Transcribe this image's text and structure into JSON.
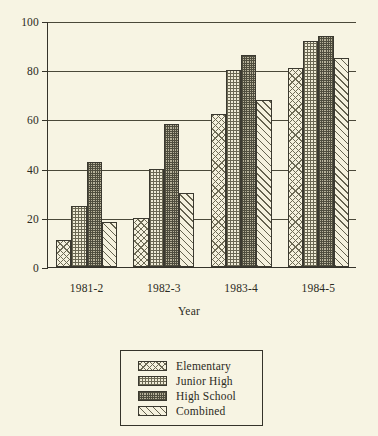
{
  "chart_data": {
    "type": "bar",
    "title": "",
    "xlabel": "Year",
    "ylabel": "",
    "ylim": [
      0,
      100
    ],
    "yticks": [
      0,
      20,
      40,
      60,
      80,
      100
    ],
    "ytick_labels": [
      "0",
      "20",
      "40",
      "60",
      "80",
      "100"
    ],
    "grid": true,
    "grid_axis": "y",
    "legend_position": "below-center",
    "categories": [
      "1981-2",
      "1982-3",
      "1983-4",
      "1984-5"
    ],
    "series": [
      {
        "name": "Elementary",
        "pattern": "cross-hatch",
        "values": [
          11,
          20,
          62,
          81
        ]
      },
      {
        "name": "Junior High",
        "pattern": "square-grid",
        "values": [
          25,
          40,
          80,
          92
        ]
      },
      {
        "name": "High School",
        "pattern": "dense-dots",
        "values": [
          42.5,
          58,
          86,
          94
        ]
      },
      {
        "name": "Combined",
        "pattern": "diagonal-hatch",
        "values": [
          18.5,
          30,
          68,
          85
        ]
      }
    ]
  },
  "colors": {
    "background": "#f7f4e3",
    "axis": "#35332a",
    "grid": "#4a4839",
    "bar_outline": "#3b3930",
    "text": "#2b2a22"
  }
}
